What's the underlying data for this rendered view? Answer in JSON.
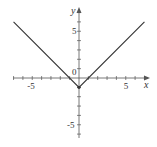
{
  "chart_data": {
    "type": "line",
    "title": "",
    "function": "y = |x| - 1",
    "xlabel": "x",
    "ylabel": "y",
    "origin_label": "0",
    "x_tick_labels": [
      "-5",
      "5"
    ],
    "y_tick_labels": [
      "5",
      "-5"
    ],
    "xlim": [
      -7,
      7
    ],
    "ylim": [
      -6,
      7
    ],
    "grid": false,
    "series": [
      {
        "name": "y = |x| - 1",
        "x": [
          -7,
          0,
          7
        ],
        "y": [
          6,
          -1,
          6
        ]
      }
    ],
    "colors": {
      "line": "#333333",
      "axis": "#555555"
    }
  }
}
